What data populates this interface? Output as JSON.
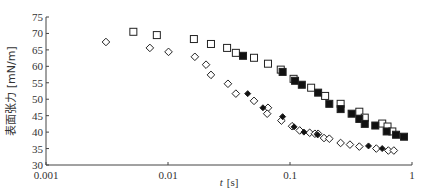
{
  "chart_data": {
    "type": "scatter",
    "title": "",
    "xlabel": "t [s]",
    "ylabel": "表面张力 [mN/m]",
    "xscale": "log",
    "xlim": [
      0.001,
      1
    ],
    "ylim": [
      30,
      75
    ],
    "xticks": [
      "0.001",
      "0.01",
      "0.1",
      "1"
    ],
    "yticks": [
      "30",
      "35",
      "40",
      "45",
      "50",
      "55",
      "60",
      "65",
      "70",
      "75"
    ],
    "grid": false,
    "legend": null,
    "series": [
      {
        "name": "open-square",
        "marker": "square-open",
        "points": [
          [
            0.0052,
            70.5
          ],
          [
            0.0081,
            69.5
          ],
          [
            0.0163,
            68.3
          ],
          [
            0.0225,
            66.8
          ],
          [
            0.0305,
            65.6
          ],
          [
            0.036,
            64.1
          ],
          [
            0.0507,
            62.6
          ],
          [
            0.066,
            60.8
          ],
          [
            0.084,
            59.0
          ],
          [
            0.107,
            56.2
          ],
          [
            0.149,
            53.5
          ],
          [
            0.194,
            51.0
          ],
          [
            0.26,
            48.6
          ],
          [
            0.37,
            46.2
          ],
          [
            0.41,
            44.4
          ],
          [
            0.57,
            42.6
          ],
          [
            0.63,
            41.7
          ],
          [
            0.69,
            40.2
          ]
        ]
      },
      {
        "name": "filled-square",
        "marker": "square-filled",
        "points": [
          [
            0.0412,
            63.2
          ],
          [
            0.087,
            58.3
          ],
          [
            0.11,
            55.6
          ],
          [
            0.125,
            54.4
          ],
          [
            0.17,
            52.0
          ],
          [
            0.21,
            48.6
          ],
          [
            0.26,
            47.0
          ],
          [
            0.32,
            45.6
          ],
          [
            0.37,
            44.0
          ],
          [
            0.41,
            42.5
          ],
          [
            0.5,
            42.0
          ],
          [
            0.62,
            40.2
          ],
          [
            0.74,
            39.2
          ],
          [
            0.86,
            38.6
          ]
        ]
      },
      {
        "name": "open-diamond",
        "marker": "diamond-open",
        "points": [
          [
            0.0031,
            67.4
          ],
          [
            0.0071,
            65.6
          ],
          [
            0.0101,
            64.4
          ],
          [
            0.0166,
            62.9
          ],
          [
            0.0205,
            60.5
          ],
          [
            0.0225,
            57.4
          ],
          [
            0.031,
            54.7
          ],
          [
            0.036,
            51.7
          ],
          [
            0.0507,
            49.5
          ],
          [
            0.066,
            47.4
          ],
          [
            0.065,
            45.6
          ],
          [
            0.085,
            43.5
          ],
          [
            0.104,
            41.8
          ],
          [
            0.12,
            40.5
          ],
          [
            0.145,
            39.8
          ],
          [
            0.16,
            39.5
          ],
          [
            0.17,
            39.5
          ],
          [
            0.19,
            38.2
          ],
          [
            0.21,
            38.0
          ],
          [
            0.26,
            36.7
          ],
          [
            0.31,
            36.2
          ],
          [
            0.37,
            35.6
          ],
          [
            0.51,
            35.0
          ],
          [
            0.64,
            34.4
          ],
          [
            0.71,
            34.4
          ]
        ]
      },
      {
        "name": "filled-diamond",
        "marker": "diamond-filled",
        "points": [
          [
            0.045,
            51.7
          ],
          [
            0.06,
            47.4
          ],
          [
            0.087,
            44.7
          ],
          [
            0.108,
            41.6
          ],
          [
            0.13,
            40.0
          ],
          [
            0.168,
            39.2
          ],
          [
            0.44,
            35.8
          ],
          [
            0.57,
            35.0
          ]
        ]
      }
    ]
  },
  "axes": {
    "x_label_main": "t",
    "x_label_unit": "[s]",
    "y_label": "表面张力 [mN/m]"
  }
}
